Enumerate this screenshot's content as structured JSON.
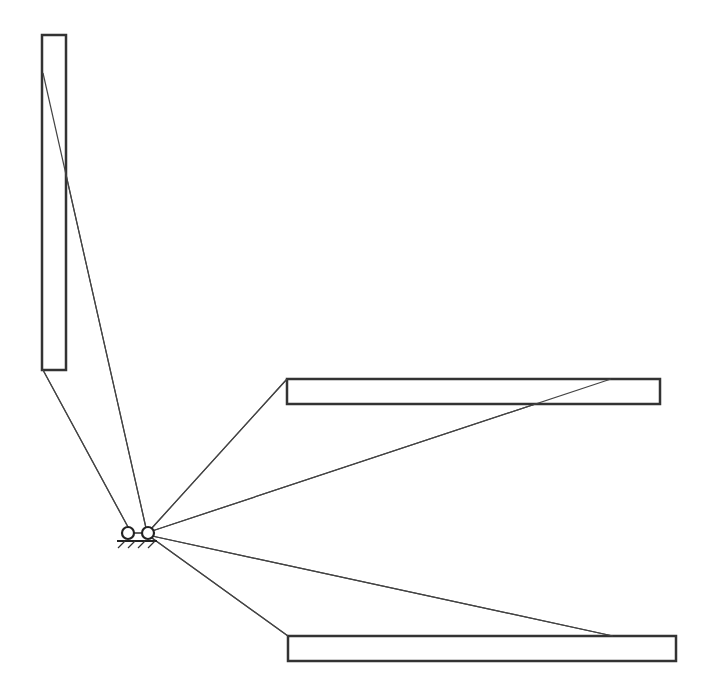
{
  "diagram": {
    "type": "mechanism-linkage",
    "canvas": {
      "width": 703,
      "height": 691,
      "background": "#ffffff"
    },
    "colors": {
      "stroke": "#333333",
      "link": "#444444",
      "fill": "#ffffff"
    },
    "bars": [
      {
        "id": "vertical-bar",
        "x": 42,
        "y": 35,
        "width": 24,
        "height": 335
      },
      {
        "id": "upper-horizontal-bar",
        "x": 287,
        "y": 379,
        "width": 373,
        "height": 25
      },
      {
        "id": "lower-horizontal-bar",
        "x": 288,
        "y": 636,
        "width": 388,
        "height": 25
      }
    ],
    "joints": [
      {
        "id": "left-pivot",
        "cx": 128,
        "cy": 533,
        "r": 6
      },
      {
        "id": "right-pivot",
        "cx": 148,
        "cy": 533,
        "r": 6
      }
    ],
    "links": [
      {
        "id": "link-vertical-top",
        "x1": 43,
        "y1": 73,
        "x2": 146,
        "y2": 528
      },
      {
        "id": "link-vertical-bottom",
        "x1": 43,
        "y1": 370,
        "x2": 128,
        "y2": 527
      },
      {
        "id": "link-upper-left",
        "x1": 287,
        "y1": 379,
        "x2": 151,
        "y2": 529
      },
      {
        "id": "link-upper-right",
        "x1": 611,
        "y1": 379,
        "x2": 152,
        "y2": 531
      },
      {
        "id": "link-lower-right",
        "x1": 613,
        "y1": 636,
        "x2": 152,
        "y2": 536
      },
      {
        "id": "link-lower-left",
        "x1": 288,
        "y1": 636,
        "x2": 152,
        "y2": 538
      },
      {
        "id": "link-between-pivots",
        "x1": 134,
        "y1": 533,
        "x2": 142,
        "y2": 533
      }
    ],
    "ground": {
      "x1": 117,
      "x2": 157,
      "y": 541,
      "hatch_count": 4,
      "hatch_dx": -7,
      "hatch_dy": 7
    }
  }
}
